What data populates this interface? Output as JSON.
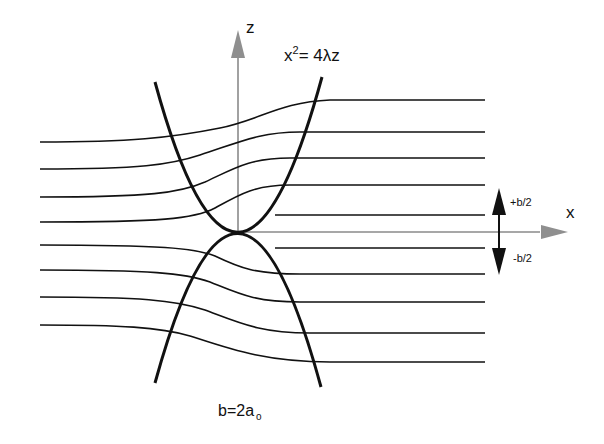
{
  "diagram": {
    "labels": {
      "z_axis": "z",
      "x_axis": "x",
      "equation_prefix": "x",
      "equation_exponent": "2",
      "equation_rest": "= 4λz",
      "plus_half_b": "+b/2",
      "minus_half_b": "-b/2",
      "b_equation_main": "b=2a",
      "b_equation_sub": "o"
    },
    "colors": {
      "stroke": "#111111",
      "axis": "#8a8a8a",
      "axis_arrow": "#8f8f8f",
      "background": "#ffffff"
    },
    "origin": {
      "x": 238,
      "y": 232
    },
    "upper_left_streamlines_y": [
      142,
      169,
      197,
      222
    ],
    "upper_right_streamlines_y": [
      100,
      132,
      158,
      185,
      215
    ],
    "lower_left_streamlines_y": [
      245,
      270,
      297,
      325
    ],
    "lower_right_streamlines_y": [
      248,
      274,
      302,
      333,
      362
    ]
  }
}
